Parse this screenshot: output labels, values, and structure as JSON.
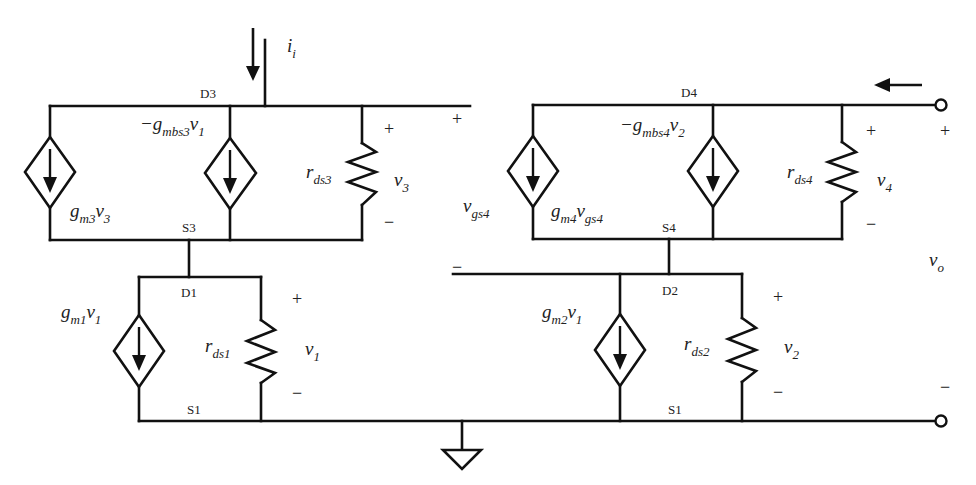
{
  "diagram": {
    "type": "small-signal equivalent circuit (cascode current mirror)",
    "nodes": {
      "d3": "D3",
      "s3": "S3",
      "d1": "D1",
      "s1_left": "S1",
      "d4": "D4",
      "s4": "S4",
      "d2": "D2",
      "s1_right": "S1"
    },
    "currents": {
      "input": {
        "sym": "i",
        "sub": "i"
      },
      "output": {
        "sym": "i",
        "sub": "o"
      }
    },
    "sources": {
      "gm3": {
        "pre": "g",
        "sub": "m3",
        "v": "v",
        "vsub": "3",
        "neg": ""
      },
      "gmbs3": {
        "pre": "g",
        "sub": "mbs3",
        "v": "v",
        "vsub": "1",
        "neg": "−"
      },
      "gm1": {
        "pre": "g",
        "sub": "m1",
        "v": "v",
        "vsub": "1",
        "neg": ""
      },
      "gm4": {
        "pre": "g",
        "sub": "m4",
        "v": "v",
        "vsub": "gs4",
        "neg": ""
      },
      "gmbs4": {
        "pre": "g",
        "sub": "mbs4",
        "v": "v",
        "vsub": "2",
        "neg": "−"
      },
      "gm2": {
        "pre": "g",
        "sub": "m2",
        "v": "v",
        "vsub": "1",
        "neg": ""
      }
    },
    "resistors": {
      "rds3": {
        "sym": "r",
        "sub": "ds3"
      },
      "rds1": {
        "sym": "r",
        "sub": "ds1"
      },
      "rds4": {
        "sym": "r",
        "sub": "ds4"
      },
      "rds2": {
        "sym": "r",
        "sub": "ds2"
      }
    },
    "voltages": {
      "v3": {
        "sym": "v",
        "sub": "3"
      },
      "v1": {
        "sym": "v",
        "sub": "1"
      },
      "v4": {
        "sym": "v",
        "sub": "4"
      },
      "v2": {
        "sym": "v",
        "sub": "2"
      },
      "vgs4": {
        "sym": "v",
        "sub": "gs4"
      },
      "vo": {
        "sym": "v",
        "sub": "o"
      }
    },
    "signs": {
      "plus": "+",
      "minus": "−"
    }
  }
}
